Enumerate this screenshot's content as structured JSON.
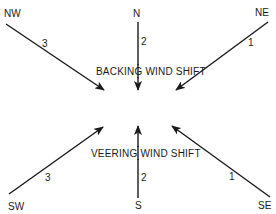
{
  "diagram": {
    "top": {
      "caption": "BACKING WIND SHIFT",
      "arrows": [
        {
          "direction": "NW",
          "order": "3"
        },
        {
          "direction": "N",
          "order": "2"
        },
        {
          "direction": "NE",
          "order": "1"
        }
      ]
    },
    "bottom": {
      "caption": "VEERING WIND SHIFT",
      "arrows": [
        {
          "direction": "SW",
          "order": "3"
        },
        {
          "direction": "S",
          "order": "2"
        },
        {
          "direction": "SE",
          "order": "1"
        }
      ]
    },
    "colors": {
      "ink": "#1a1a1a",
      "background": "#ffffff"
    }
  }
}
